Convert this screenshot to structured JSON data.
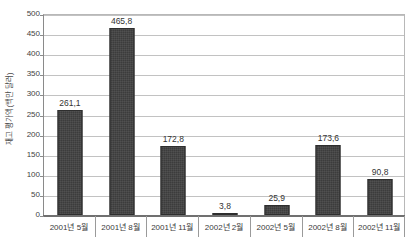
{
  "chart_data": {
    "type": "bar",
    "title": "",
    "subtitle": "",
    "xlabel": "",
    "ylabel": "재고 평가액(백만 달러)",
    "ylim": [
      0,
      500
    ],
    "ytick_step": 50,
    "yticks": [
      500,
      450,
      400,
      350,
      300,
      250,
      200,
      150,
      100,
      50,
      0
    ],
    "ytick_labels": [
      "500",
      "450",
      "400",
      "350",
      "300",
      "250",
      "200",
      "150",
      "100",
      "50",
      "0"
    ],
    "grid": true,
    "legend": false,
    "legend_position": "none",
    "categories": [
      "2001년 5월",
      "2001년 8월",
      "2001년 11월",
      "2002년 2월",
      "2002년 5월",
      "2002년 8월",
      "2002년 11월"
    ],
    "values": [
      261.1,
      465.8,
      172.8,
      3.8,
      25.9,
      173.6,
      90.8
    ],
    "value_labels": [
      "261,1",
      "465,8",
      "172,8",
      "3,8",
      "25,9",
      "173,6",
      "90,8"
    ],
    "bar_color": "#3c3c3c",
    "gridline_color": "#c2c2c2",
    "axis_color": "#707070",
    "text_color": "#3a3a3a"
  }
}
